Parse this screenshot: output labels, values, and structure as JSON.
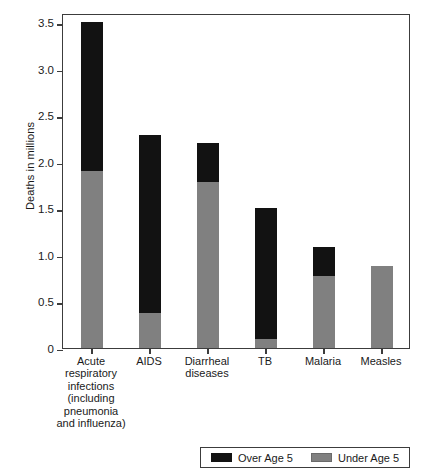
{
  "chart_data": {
    "type": "bar",
    "subtype": "stacked-bar",
    "title": "",
    "xlabel": "",
    "ylabel": "Deaths in millions",
    "ylim": [
      0,
      3.6
    ],
    "grid": false,
    "legend_position": "bottom",
    "categories": [
      "Acute\nrespiratory\ninfections\n(including\npneumonia\nand influenza)",
      "AIDS",
      "Diarrheal\ndiseases",
      "TB",
      "Malaria",
      "Measles"
    ],
    "category_short": [
      "Acute respiratory infections",
      "AIDS",
      "Diarrheal diseases",
      "TB",
      "Malaria",
      "Measles"
    ],
    "series": [
      {
        "name": "Under Age 5",
        "color": "#808080",
        "values": [
          1.9,
          0.38,
          1.78,
          0.1,
          0.77,
          0.88
        ]
      },
      {
        "name": "Over Age 5",
        "color": "#121212",
        "values": [
          1.6,
          1.91,
          0.42,
          1.4,
          0.32,
          0.0
        ]
      }
    ],
    "totals": [
      3.49,
      2.29,
      2.2,
      1.5,
      1.09,
      0.88
    ],
    "y_ticks": [
      {
        "value": 0,
        "label": "0"
      },
      {
        "value": 0.5,
        "label": "0.5"
      },
      {
        "value": 1.0,
        "label": "1.0"
      },
      {
        "value": 1.5,
        "label": "1.5"
      },
      {
        "value": 2.0,
        "label": "2.0"
      },
      {
        "value": 2.5,
        "label": "2.5"
      },
      {
        "value": 3.0,
        "label": "3.0"
      },
      {
        "value": 3.5,
        "label": "3.5"
      }
    ]
  },
  "axis": {
    "y_title": "Deaths in millions"
  },
  "legend": {
    "entries": [
      {
        "label": "Over Age 5",
        "swatch": "black-swatch-icon"
      },
      {
        "label": "Under Age 5",
        "swatch": "gray-swatch-icon"
      }
    ]
  }
}
